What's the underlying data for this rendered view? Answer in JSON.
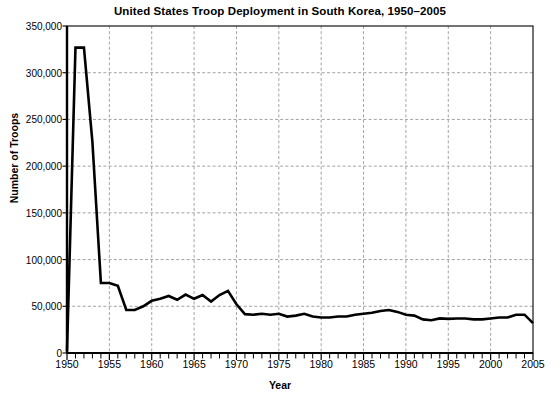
{
  "chart_data": {
    "type": "line",
    "title": "United States Troop Deployment in South Korea, 1950–2005",
    "xlabel": "Year",
    "ylabel": "Number of Troops",
    "xlim": [
      1950,
      2005
    ],
    "ylim": [
      0,
      350000
    ],
    "grid": true,
    "legend": "none",
    "line_color": "#000000",
    "grid_color": "#999999",
    "axis_color": "#000000",
    "background": "#ffffff",
    "ytick_labels": [
      "350,000",
      "300,000",
      "250,000",
      "200,000",
      "150,000",
      "100,000",
      "50,000",
      "0"
    ],
    "ytick_values": [
      350000,
      300000,
      250000,
      200000,
      150000,
      100000,
      50000,
      0
    ],
    "xtick_labels": [
      "1950",
      "1955",
      "1960",
      "1965",
      "1970",
      "1975",
      "1980",
      "1985",
      "1990",
      "1995",
      "2000",
      "2005"
    ],
    "xtick_values": [
      1950,
      1955,
      1960,
      1965,
      1970,
      1975,
      1980,
      1985,
      1990,
      1995,
      2000,
      2005
    ],
    "x_minor_tick_interval": 1,
    "series": [
      {
        "name": "US troops in South Korea",
        "x": [
          1950,
          1951,
          1952,
          1953,
          1954,
          1955,
          1956,
          1957,
          1958,
          1959,
          1960,
          1961,
          1962,
          1963,
          1964,
          1965,
          1966,
          1967,
          1968,
          1969,
          1970,
          1971,
          1972,
          1973,
          1974,
          1975,
          1976,
          1977,
          1978,
          1979,
          1980,
          1981,
          1982,
          1983,
          1984,
          1985,
          1986,
          1987,
          1988,
          1989,
          1990,
          1991,
          1992,
          1993,
          1994,
          1995,
          1996,
          1997,
          1998,
          1999,
          2000,
          2001,
          2002,
          2003,
          2004,
          2005
        ],
        "y": [
          2000,
          326863,
          326863,
          225590,
          75000,
          75000,
          72000,
          46024,
          46000,
          50000,
          55864,
          58000,
          61000,
          57000,
          62596,
          58000,
          62000,
          55000,
          62000,
          66531,
          52197,
          41600,
          41000,
          42000,
          41000,
          42000,
          39000,
          40000,
          42000,
          39000,
          38000,
          38000,
          39000,
          39000,
          41000,
          42000,
          43000,
          45000,
          46000,
          44000,
          41000,
          40000,
          36000,
          35000,
          37000,
          36500,
          37000,
          37000,
          36000,
          36000,
          37000,
          38000,
          38000,
          41000,
          41000,
          32000
        ]
      }
    ]
  },
  "axes": {
    "plot_left_px": 67,
    "plot_right_px": 533,
    "plot_top_px": 26,
    "plot_bottom_px": 353
  }
}
